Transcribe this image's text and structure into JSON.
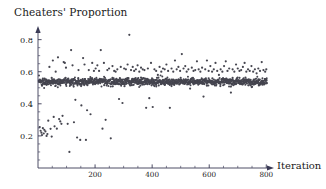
{
  "chart_data": {
    "type": "scatter",
    "title": "Cheaters' Proportion",
    "xlabel": "Iteration",
    "ylabel": "",
    "xlim": [
      0,
      820
    ],
    "ylim": [
      0,
      0.86
    ],
    "grid": false,
    "legend": null,
    "x_ticks": [
      200,
      400,
      600,
      800
    ],
    "x_tick_labels": [
      "200",
      "400",
      "600",
      "800"
    ],
    "x_minor_step": 50,
    "y_ticks": [
      0.2,
      0.4,
      0.6,
      0.8
    ],
    "y_tick_labels": [
      "0.2",
      "0.4",
      "0.6",
      "0.8"
    ],
    "y_minor_step": 0.05,
    "marker_color": "#45454f",
    "marker_size_px": 1.1,
    "series": [
      {
        "name": "Cheaters' Proportion",
        "description": "Dense equilibrium band near 0.54 across all iterations with sparse outliers; low outliers cluster in early iterations, high outliers spread throughout.",
        "band_center": 0.538,
        "band_halfwidth": 0.018,
        "n_band_points": 800,
        "outliers": [
          [
            6,
            0.255
          ],
          [
            9,
            0.232
          ],
          [
            12,
            0.22
          ],
          [
            14,
            0.205
          ],
          [
            17,
            0.248
          ],
          [
            20,
            0.215
          ],
          [
            22,
            0.238
          ],
          [
            26,
            0.228
          ],
          [
            30,
            0.2
          ],
          [
            33,
            0.212
          ],
          [
            36,
            0.295
          ],
          [
            40,
            0.63
          ],
          [
            44,
            0.244
          ],
          [
            48,
            0.196
          ],
          [
            52,
            0.67
          ],
          [
            55,
            0.318
          ],
          [
            58,
            0.26
          ],
          [
            62,
            0.6
          ],
          [
            66,
            0.245
          ],
          [
            70,
            0.69
          ],
          [
            74,
            0.305
          ],
          [
            78,
            0.29
          ],
          [
            82,
            0.275
          ],
          [
            86,
            0.325
          ],
          [
            90,
            0.66
          ],
          [
            94,
            0.655
          ],
          [
            98,
            0.625
          ],
          [
            104,
            0.275
          ],
          [
            110,
            0.1
          ],
          [
            116,
            0.735
          ],
          [
            121,
            0.64
          ],
          [
            126,
            0.285
          ],
          [
            131,
            0.425
          ],
          [
            137,
            0.19
          ],
          [
            142,
            0.61
          ],
          [
            148,
            0.175
          ],
          [
            152,
            0.39
          ],
          [
            158,
            0.685
          ],
          [
            163,
            0.645
          ],
          [
            168,
            0.175
          ],
          [
            172,
            0.36
          ],
          [
            178,
            0.61
          ],
          [
            184,
            0.335
          ],
          [
            190,
            0.655
          ],
          [
            196,
            0.605
          ],
          [
            202,
            0.62
          ],
          [
            208,
            0.64
          ],
          [
            214,
            0.605
          ],
          [
            220,
            0.735
          ],
          [
            226,
            0.245
          ],
          [
            231,
            0.655
          ],
          [
            237,
            0.3
          ],
          [
            243,
            0.61
          ],
          [
            249,
            0.62
          ],
          [
            255,
            0.185
          ],
          [
            261,
            0.635
          ],
          [
            267,
            0.605
          ],
          [
            272,
            0.6
          ],
          [
            278,
            0.615
          ],
          [
            284,
            0.43
          ],
          [
            290,
            0.63
          ],
          [
            296,
            0.405
          ],
          [
            302,
            0.62
          ],
          [
            308,
            0.615
          ],
          [
            314,
            0.645
          ],
          [
            320,
            0.83
          ],
          [
            326,
            0.61
          ],
          [
            332,
            0.63
          ],
          [
            337,
            0.605
          ],
          [
            343,
            0.615
          ],
          [
            349,
            0.64
          ],
          [
            355,
            0.6
          ],
          [
            361,
            0.625
          ],
          [
            367,
            0.615
          ],
          [
            373,
            0.61
          ],
          [
            379,
            0.375
          ],
          [
            385,
            0.62
          ],
          [
            390,
            0.435
          ],
          [
            396,
            0.655
          ],
          [
            402,
            0.38
          ],
          [
            408,
            0.615
          ],
          [
            414,
            0.605
          ],
          [
            420,
            0.58
          ],
          [
            426,
            0.63
          ],
          [
            432,
            0.6
          ],
          [
            438,
            0.62
          ],
          [
            444,
            0.615
          ],
          [
            450,
            0.645
          ],
          [
            456,
            0.605
          ],
          [
            462,
            0.375
          ],
          [
            468,
            0.62
          ],
          [
            474,
            0.6
          ],
          [
            480,
            0.67
          ],
          [
            486,
            0.615
          ],
          [
            492,
            0.63
          ],
          [
            498,
            0.605
          ],
          [
            504,
            0.71
          ],
          [
            510,
            0.62
          ],
          [
            516,
            0.635
          ],
          [
            521,
            0.6
          ],
          [
            527,
            0.615
          ],
          [
            533,
            0.495
          ],
          [
            539,
            0.625
          ],
          [
            545,
            0.605
          ],
          [
            551,
            0.61
          ],
          [
            557,
            0.665
          ],
          [
            563,
            0.615
          ],
          [
            569,
            0.6
          ],
          [
            575,
            0.625
          ],
          [
            580,
            0.445
          ],
          [
            586,
            0.615
          ],
          [
            592,
            0.67
          ],
          [
            598,
            0.605
          ],
          [
            604,
            0.635
          ],
          [
            610,
            0.6
          ],
          [
            616,
            0.615
          ],
          [
            622,
            0.655
          ],
          [
            628,
            0.605
          ],
          [
            634,
            0.58
          ],
          [
            640,
            0.615
          ],
          [
            646,
            0.6
          ],
          [
            652,
            0.635
          ],
          [
            658,
            0.665
          ],
          [
            664,
            0.605
          ],
          [
            670,
            0.62
          ],
          [
            676,
            0.47
          ],
          [
            682,
            0.615
          ],
          [
            688,
            0.6
          ],
          [
            694,
            0.645
          ],
          [
            700,
            0.62
          ],
          [
            706,
            0.605
          ],
          [
            712,
            0.61
          ],
          [
            718,
            0.63
          ],
          [
            724,
            0.655
          ],
          [
            730,
            0.6
          ],
          [
            736,
            0.615
          ],
          [
            742,
            0.605
          ],
          [
            748,
            0.635
          ],
          [
            754,
            0.6
          ],
          [
            760,
            0.615
          ],
          [
            766,
            0.59
          ],
          [
            772,
            0.62
          ],
          [
            778,
            0.605
          ],
          [
            784,
            0.66
          ],
          [
            790,
            0.61
          ],
          [
            796,
            0.6
          ],
          [
            800,
            0.615
          ]
        ]
      }
    ]
  }
}
